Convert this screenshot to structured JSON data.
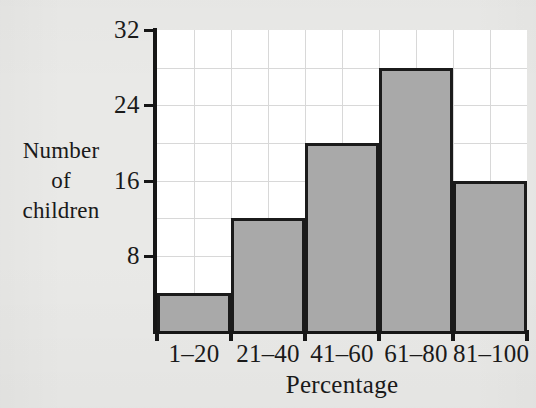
{
  "chart_data": {
    "type": "bar",
    "title": "",
    "subtitle": "",
    "xlabel": "Percentage",
    "ylabel": "Number of children",
    "ylabel_lines": [
      "Number",
      "of",
      "children"
    ],
    "categories": [
      "1–20",
      "21–40",
      "41–60",
      "61–80",
      "81–100"
    ],
    "values": [
      4,
      12,
      20,
      28,
      16
    ],
    "ylim": [
      0,
      32
    ],
    "xlim": [
      0,
      5
    ],
    "ytick_labels": [
      "8",
      "16",
      "24",
      "32"
    ],
    "ytick_values": [
      8,
      16,
      24,
      32
    ],
    "ygrid_values": [
      4,
      8,
      12,
      16,
      20,
      24,
      28,
      32
    ],
    "grid": true,
    "grid_columns_per_bar": 2,
    "legend": null,
    "legend_position": "none",
    "bar_fill_color": "#a9a9a9",
    "bar_edge_color": "#1b1b1b",
    "plot_background": "#ffffff",
    "page_background": "#e9e9e7",
    "grid_color": "#d8d8d8",
    "axis_color": "#161616"
  }
}
